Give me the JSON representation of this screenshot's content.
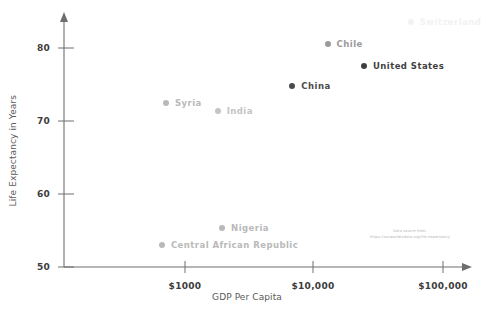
{
  "chart_data": {
    "type": "scatter",
    "title": "",
    "xlabel": "GDP Per Capita",
    "ylabel": "Life Expectancy in Years",
    "x_scale": "log",
    "xticks": [
      "$1000",
      "$10,000",
      "$100,000"
    ],
    "xtick_values": [
      1000,
      10000,
      100000
    ],
    "yticks": [
      "50",
      "60",
      "70",
      "80"
    ],
    "ytick_values": [
      50,
      60,
      70,
      80
    ],
    "ylim": [
      50,
      85
    ],
    "grid": false,
    "legend": "none",
    "points": [
      {
        "label": "Central African Republic",
        "gdp": 660,
        "life_expectancy": 53.0,
        "color": "#b9b9b9"
      },
      {
        "label": "Nigeria",
        "gdp": 1950,
        "life_expectancy": 55.3,
        "color": "#b9b9b9"
      },
      {
        "label": "Syria",
        "gdp": 710,
        "life_expectancy": 72.5,
        "color": "#b9b9b9"
      },
      {
        "label": "India",
        "gdp": 1800,
        "life_expectancy": 71.4,
        "color": "#c4c4c4"
      },
      {
        "label": "China",
        "gdp": 6900,
        "life_expectancy": 74.8,
        "color": "#4a4a4a"
      },
      {
        "label": "Chile",
        "gdp": 13000,
        "life_expectancy": 80.6,
        "color": "#9a9a9a"
      },
      {
        "label": "United States",
        "gdp": 25000,
        "life_expectancy": 77.6,
        "color": "#3f3f3f"
      },
      {
        "label": "Switzerland",
        "gdp": 58000,
        "life_expectancy": 83.5,
        "color": "#f2f2f2"
      }
    ]
  },
  "source": {
    "line1": "Data source from:",
    "line2": "https://ourworldindata.org/life-expectancy"
  },
  "colors": {
    "axis": "#6e6e6e",
    "tick_label": "#3c3c3c",
    "axis_title": "#5a5a5a",
    "source_text": "#b4b4b4"
  }
}
